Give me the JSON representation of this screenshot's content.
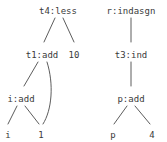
{
  "figure": {
    "background_color": "#ffffff",
    "edge_color": "#4a4a4a",
    "text_color": "#3a3a3a"
  },
  "trees": [
    {
      "name": "left-tree",
      "root": "t4:less",
      "nodes": [
        {
          "id": "t4less",
          "label": "t4:less",
          "x": 58,
          "y": 6,
          "type": "internal"
        },
        {
          "id": "t1add",
          "label": "t1:add",
          "x": 42,
          "y": 50,
          "type": "internal"
        },
        {
          "id": "ten",
          "label": "10",
          "x": 74,
          "y": 50,
          "type": "leaf"
        },
        {
          "id": "iadd",
          "label": "i:add",
          "x": 21,
          "y": 94,
          "type": "internal"
        },
        {
          "id": "i",
          "label": "i",
          "x": 8,
          "y": 130,
          "type": "leaf"
        },
        {
          "id": "one",
          "label": "1",
          "x": 41,
          "y": 130,
          "type": "leaf"
        }
      ],
      "edges": [
        {
          "from": "t4less",
          "to": "t1add",
          "style": "straight"
        },
        {
          "from": "t4less",
          "to": "ten",
          "style": "straight"
        },
        {
          "from": "t1add",
          "to": "iadd",
          "style": "straight"
        },
        {
          "from": "t1add",
          "to": "one",
          "style": "curved"
        },
        {
          "from": "iadd",
          "to": "i",
          "style": "straight"
        },
        {
          "from": "iadd",
          "to": "one",
          "style": "straight"
        }
      ]
    },
    {
      "name": "right-tree",
      "root": "r:indasgn",
      "nodes": [
        {
          "id": "rindasgn",
          "label": "r:indasgn",
          "x": 131,
          "y": 6,
          "type": "internal"
        },
        {
          "id": "t3ind",
          "label": "t3:ind",
          "x": 131,
          "y": 50,
          "type": "internal"
        },
        {
          "id": "padd",
          "label": "p:add",
          "x": 131,
          "y": 94,
          "type": "internal"
        },
        {
          "id": "p",
          "label": "p",
          "x": 113,
          "y": 130,
          "type": "leaf"
        },
        {
          "id": "four",
          "label": "4",
          "x": 152,
          "y": 130,
          "type": "leaf"
        }
      ],
      "edges": [
        {
          "from": "rindasgn",
          "to": "t3ind",
          "style": "straight"
        },
        {
          "from": "t3ind",
          "to": "padd",
          "style": "straight"
        },
        {
          "from": "padd",
          "to": "p",
          "style": "straight"
        },
        {
          "from": "padd",
          "to": "four",
          "style": "straight"
        }
      ]
    }
  ]
}
